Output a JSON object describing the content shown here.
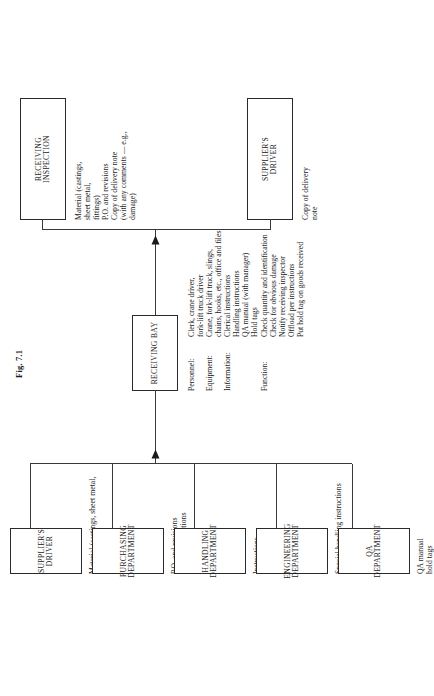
{
  "figure": {
    "caption": "Fig. 7.1"
  },
  "nodes": {
    "receiving_inspection": {
      "line1": "RECEIVING",
      "line2": "INSPECTION",
      "outputs": "Material (castings,\nsheet metal,\nfittings)\nP.O. and revisions\nCopy of delivery note\n(with any comments — e.g.,\ndamage)"
    },
    "suppliers_driver_out": {
      "line1": "SUPPLIER'S",
      "line2": "DRIVER",
      "outputs": "Copy of delivery\nnote"
    },
    "receiving_bay": {
      "line1": "RECEIVING BAY",
      "line2": ""
    }
  },
  "receiving_bay_spec": {
    "rows": [
      {
        "label": "Personnel:",
        "value": "Clerk, crane driver,\nfork-lift truck driver"
      },
      {
        "label": "Equipment:",
        "value": "Crane, fork-lift truck, slings,\nchains, hooks, etc., office and files"
      },
      {
        "label": "Information:",
        "value": "Clerical instructions\nHandling instructions\nQA manual (with manager)\nHold tags"
      },
      {
        "label": "Function:",
        "value": "Check quantity and identification\nCheck for obvious damage\nNotify receiving inspector\nOffload per instructions\nPut hold tag on goods received"
      }
    ]
  },
  "inputs": [
    {
      "line1": "SUPPLIER'S",
      "line2": "DRIVER",
      "annotation": "Material (castings, sheet metal,\nfittings)\nDelivery note"
    },
    {
      "line1": "PURCHASING",
      "line2": "DEPARTMENT",
      "annotation": "P.O. and revisions\nclerical instructions"
    },
    {
      "line1": "HANDLING",
      "line2": "DEPARTMENT",
      "annotation": "Instructions"
    },
    {
      "line1": "ENGINEERING",
      "line2": "DEPARTMENT",
      "annotation": "Special handling instructions"
    },
    {
      "line1": "QA",
      "line2": "DEPARTMENT",
      "annotation": "QA manual\nhold tags"
    }
  ],
  "colors": {
    "ink": "#1a1a1a",
    "line": "#3a3a3a",
    "background": "#ffffff"
  }
}
